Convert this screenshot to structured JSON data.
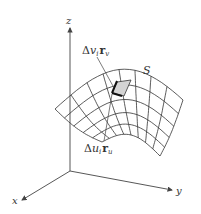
{
  "diagram": {
    "axes": {
      "x_label": "x",
      "y_label": "y",
      "z_label": "z"
    },
    "surface_label": "S",
    "annotations": {
      "top": {
        "delta": "Δ",
        "var": "v",
        "sub": "i",
        "vec": "r",
        "vec_sub": "v"
      },
      "bottom": {
        "delta": "Δ",
        "var": "u",
        "sub": "i",
        "vec": "r",
        "vec_sub": "u"
      }
    },
    "grid": {
      "rows": 5,
      "cols": 8
    },
    "colors": {
      "line": "#333333",
      "patch_fill": "#d4d4d4",
      "background": "#ffffff"
    }
  }
}
